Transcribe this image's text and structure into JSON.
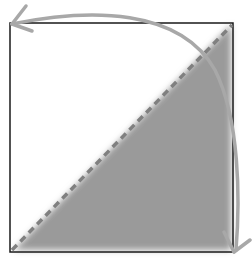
{
  "diagram": {
    "square": {
      "x": 10,
      "y": 23,
      "size": 223,
      "stroke": "#1a1a1a"
    },
    "diagonal": {
      "style": "dashed",
      "color": "#808080"
    },
    "shaded_region": {
      "shape": "triangle",
      "corner": "bottom-right",
      "color": "#9a9a9a"
    },
    "rotation_arrow": {
      "direction": "counterclockwise-ends-both",
      "color": "#a8a8a8",
      "arrowheads": [
        "top-left",
        "bottom-right"
      ]
    }
  }
}
